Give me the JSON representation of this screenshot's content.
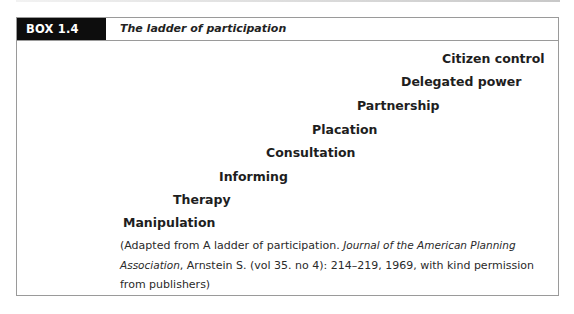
{
  "box": {
    "label": "BOX 1.4",
    "title": "The ladder of participation",
    "colors": {
      "label_bg": "#0d0d0d",
      "label_text": "#ffffff",
      "border": "#9a9a9a"
    }
  },
  "ladder": {
    "rungs": [
      {
        "label": "Citizen control",
        "level": 8
      },
      {
        "label": "Delegated power",
        "level": 7
      },
      {
        "label": "Partnership",
        "level": 6
      },
      {
        "label": "Placation",
        "level": 5
      },
      {
        "label": "Consultation",
        "level": 4
      },
      {
        "label": "Informing",
        "level": 3
      },
      {
        "label": "Therapy",
        "level": 2
      },
      {
        "label": "Manipulation",
        "level": 1
      }
    ]
  },
  "caption": {
    "prefix": "(Adapted from A ladder of participation. ",
    "journal": "Journal of the American Planning Association",
    "suffix": ", Arnstein S. (vol 35. no 4): 214–219, 1969, with kind permission from publishers)"
  }
}
